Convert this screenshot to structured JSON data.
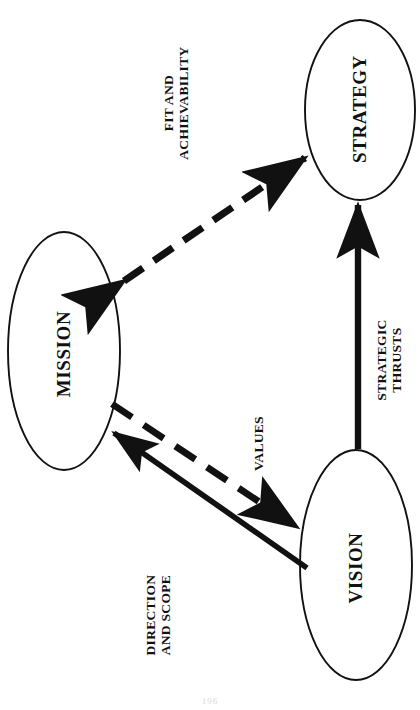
{
  "figure": {
    "orientation": "rotated-90-ccw",
    "page_number": "196",
    "background_color": "#ffffff",
    "stroke_color": "#111111"
  },
  "nodes": [
    {
      "id": "mission",
      "label": "MISSION",
      "cx": 64,
      "cy": 351,
      "rx": 56,
      "ry": 119
    },
    {
      "id": "strategy",
      "label": "STRATEGY",
      "cx": 360,
      "cy": 110,
      "rx": 55,
      "ry": 90
    },
    {
      "id": "vision",
      "label": "VISION",
      "cx": 356,
      "cy": 565,
      "rx": 56,
      "ry": 115
    }
  ],
  "edges": [
    {
      "id": "mission-strategy",
      "from": "mission",
      "to": "strategy",
      "style": "dashed",
      "heads": "both",
      "label_lines": [
        "FIT AND",
        "ACHIEVABILITY"
      ]
    },
    {
      "id": "vision-strategy",
      "from": "vision",
      "to": "strategy",
      "style": "solid",
      "heads": "to",
      "label_lines": [
        "STRATEGIC",
        "THRUSTS"
      ]
    },
    {
      "id": "mission-vision-values",
      "from": "mission",
      "to": "vision",
      "style": "dashed",
      "heads": "to",
      "label_lines": [
        "VALUES"
      ]
    },
    {
      "id": "vision-mission-direction",
      "from": "vision",
      "to": "mission",
      "style": "solid",
      "heads": "to",
      "label_lines": [
        "DIRECTION",
        "AND SCOPE"
      ]
    }
  ],
  "labels": {
    "mission": "MISSION",
    "strategy": "STRATEGY",
    "vision": "VISION",
    "fit_and_achievability_line1": "FIT AND",
    "fit_and_achievability_line2": "ACHIEVABILITY",
    "strategic_thrusts_line1": "STRATEGIC",
    "strategic_thrusts_line2": "THRUSTS",
    "values": "VALUES",
    "direction_and_scope_line1": "DIRECTION",
    "direction_and_scope_line2": "AND SCOPE"
  }
}
